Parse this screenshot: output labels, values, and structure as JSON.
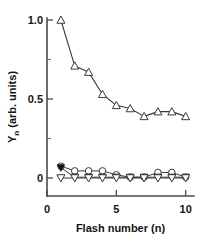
{
  "chart_data": {
    "type": "line",
    "title": "",
    "xlabel": "Flash number (n)",
    "ylabel": "Yn (arb. units)",
    "ylabel_main": "Y",
    "ylabel_sub": "n",
    "ylabel_rest": " (arb. units)",
    "x": [
      1,
      2,
      3,
      4,
      5,
      6,
      7,
      8,
      9,
      10
    ],
    "xlim": [
      0,
      10.6
    ],
    "ylim": [
      -0.09,
      1.06
    ],
    "xticks": [
      0,
      5,
      10
    ],
    "xtick_labels": [
      "0",
      "5",
      "10"
    ],
    "yticks": [
      0,
      0.5,
      1.0
    ],
    "ytick_labels": [
      "0",
      "0.5",
      "1.0"
    ],
    "yticks_minor": [
      0.25,
      0.75
    ],
    "grid": false,
    "legend": false,
    "series": [
      {
        "name": "upper-open-triangle-up",
        "marker": "triangle-up-open",
        "values": [
          1.0,
          0.71,
          0.67,
          0.53,
          0.46,
          0.44,
          0.39,
          0.42,
          0.42,
          0.39
        ]
      },
      {
        "name": "open-circle",
        "marker": "circle-open",
        "values": [
          0.075,
          0.045,
          0.045,
          0.045,
          0.02,
          0.005,
          0.005,
          0.035,
          0.035,
          0.005
        ]
      },
      {
        "name": "filled-marker",
        "marker": "triangle-down-filled",
        "values": [
          0.065,
          0.005,
          0.005,
          0.005,
          0.005,
          0.005,
          0.005,
          0.005,
          0.005,
          0.005
        ]
      },
      {
        "name": "open-triangle-down",
        "marker": "triangle-down-open",
        "values": [
          0.0,
          0.0,
          0.0,
          0.0,
          0.0,
          0.0,
          0.0,
          0.0,
          0.0,
          0.0
        ]
      }
    ]
  }
}
